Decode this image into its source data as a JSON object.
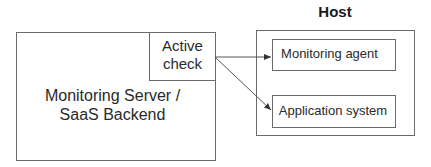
{
  "server": {
    "label_line1": "Monitoring Server /",
    "label_line2": "SaaS Backend"
  },
  "active_check": {
    "line1": "Active",
    "line2": "check"
  },
  "host": {
    "title": "Host",
    "components": [
      {
        "label": "Monitoring agent"
      },
      {
        "label": "Application system"
      }
    ]
  },
  "colors": {
    "stroke": "#6a6a6a",
    "text": "#2a2a2a"
  }
}
